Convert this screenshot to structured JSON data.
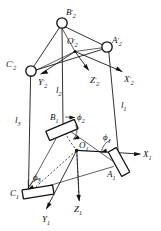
{
  "figure": {
    "background_color": "#ffffff",
    "line_color": "#1a1a1a"
  },
  "upper_platform": {
    "joints": [
      {
        "id": "B2p",
        "label": "B",
        "prime": "′",
        "subscript": "2",
        "cx": 62,
        "cy": 23,
        "r": 5.2
      },
      {
        "id": "A2p",
        "label": "A",
        "prime": "′",
        "subscript": "2",
        "cx": 107,
        "cy": 47,
        "r": 5.2
      },
      {
        "id": "C2p",
        "label": "C",
        "prime": "′",
        "subscript": "2",
        "cx": 31,
        "cy": 71,
        "r": 5.2
      }
    ],
    "origin": {
      "id": "O2p",
      "label": "O",
      "prime": "′",
      "subscript": "2",
      "x": 76,
      "y": 46
    },
    "axes": [
      {
        "id": "X2p",
        "label": "X",
        "prime": "′",
        "subscript": "2",
        "x": 124,
        "y": 78
      },
      {
        "id": "Y2p",
        "label": "Y",
        "prime": "′",
        "subscript": "2",
        "x": 42,
        "y": 80
      },
      {
        "id": "Z2p",
        "label": "Z",
        "prime": "′",
        "subscript": "2",
        "x": 92,
        "y": 78
      }
    ]
  },
  "lower_platform": {
    "joints": [
      {
        "id": "B1",
        "label": "B",
        "prime": "",
        "subscript": "1",
        "x": 57,
        "y": 117
      },
      {
        "id": "A1",
        "label": "A",
        "prime": "",
        "subscript": "1",
        "x": 110,
        "y": 174
      },
      {
        "id": "C1",
        "label": "C",
        "prime": "",
        "subscript": "1",
        "x": 17,
        "y": 192
      }
    ],
    "origin": {
      "id": "O1",
      "label": "O",
      "prime": "",
      "subscript": "1",
      "x": 79,
      "y": 150
    },
    "axes": [
      {
        "id": "X1",
        "label": "X",
        "prime": "",
        "subscript": "1",
        "x": 146,
        "y": 158
      },
      {
        "id": "Y1",
        "label": "Y",
        "prime": "",
        "subscript": "1",
        "x": 48,
        "y": 217
      },
      {
        "id": "Z1",
        "label": "Z",
        "prime": "",
        "subscript": "1",
        "x": 78,
        "y": 208
      }
    ]
  },
  "links": [
    {
      "id": "l1",
      "label": "l",
      "subscript": "1",
      "x": 122,
      "y": 105
    },
    {
      "id": "l2",
      "label": "l",
      "subscript": "2",
      "x": 62,
      "y": 93
    },
    {
      "id": "l3",
      "label": "l",
      "subscript": "3",
      "x": 18,
      "y": 120
    }
  ],
  "angles": [
    {
      "id": "phi1",
      "label": "ϕ",
      "subscript": "1",
      "x": 106,
      "y": 143
    },
    {
      "id": "phi2",
      "label": "ϕ",
      "subscript": "2",
      "x": 80,
      "y": 120
    },
    {
      "id": "phi3",
      "label": "ϕ",
      "subscript": "3",
      "x": 36,
      "y": 177
    }
  ]
}
